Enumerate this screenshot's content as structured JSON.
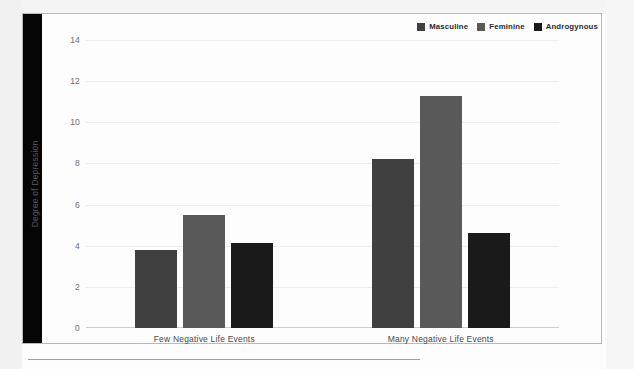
{
  "chart_data": {
    "type": "bar",
    "title": "",
    "xlabel": "",
    "ylabel": "Degree of Depression",
    "categories": [
      "Few Negative Life Events",
      "Many Negative Life Events"
    ],
    "series": [
      {
        "name": "Masculine",
        "color": "#404040",
        "values": [
          3.8,
          8.2
        ]
      },
      {
        "name": "Feminine",
        "color": "#595959",
        "values": [
          5.5,
          11.3
        ]
      },
      {
        "name": "Androgynous",
        "color": "#1a1a1a",
        "values": [
          4.15,
          4.6
        ]
      }
    ],
    "ylim": [
      0,
      14
    ],
    "yticks": [
      0,
      2,
      4,
      6,
      8,
      10,
      12,
      14
    ],
    "ytick_labels": [
      "0",
      "2",
      "4",
      "6",
      "8",
      "10",
      "12",
      "14"
    ],
    "grid": true,
    "legend_position": "top-right"
  },
  "legend": {
    "items": [
      {
        "label": "Masculine",
        "color": "#404040"
      },
      {
        "label": "Feminine",
        "color": "#595959"
      },
      {
        "label": "Androgynous",
        "color": "#1a1a1a"
      }
    ]
  }
}
